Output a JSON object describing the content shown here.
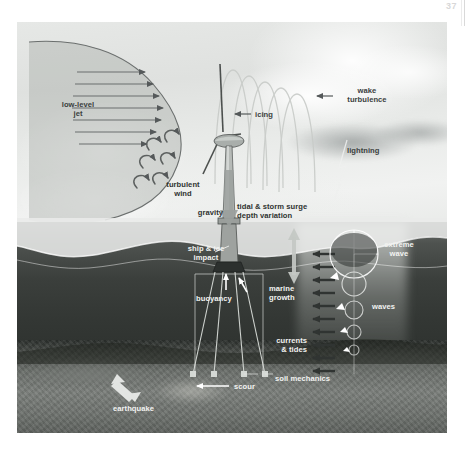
{
  "page": {
    "number": "37"
  },
  "figure": {
    "labels": [
      {
        "id": "low-level-jet",
        "text": "low-level\njet"
      },
      {
        "id": "icing",
        "text": "icing"
      },
      {
        "id": "wake-turbulence",
        "text": "wake\nturbulence"
      },
      {
        "id": "lightning",
        "text": "lightning"
      },
      {
        "id": "turbulent-wind",
        "text": "turbulent\nwind"
      },
      {
        "id": "gravity",
        "text": "gravity"
      },
      {
        "id": "tidal-storm-surge",
        "text": "tidal & storm surge\ndepth variation"
      },
      {
        "id": "extreme-wave",
        "text": "extreme\nwave"
      },
      {
        "id": "ship-ice-impact",
        "text": "ship & ice\nimpact"
      },
      {
        "id": "buoyancy",
        "text": "buoyancy"
      },
      {
        "id": "marine-growth",
        "text": "marine\ngrowth"
      },
      {
        "id": "waves",
        "text": "waves"
      },
      {
        "id": "currents-tides",
        "text": "currents\n& tides"
      },
      {
        "id": "soil-mechanics",
        "text": "soil mechanics"
      },
      {
        "id": "scour",
        "text": "scour"
      },
      {
        "id": "earthquake",
        "text": "earthquake"
      }
    ],
    "colors": {
      "sky": "#e6e8e6",
      "sea": "#3b3f3c",
      "seabed": "#6e726e",
      "label_dark": "#3b3f3e",
      "label_light": "#f2f3f1",
      "arrow_dark": "#55595a",
      "arrow_light": "#ffffff"
    }
  }
}
